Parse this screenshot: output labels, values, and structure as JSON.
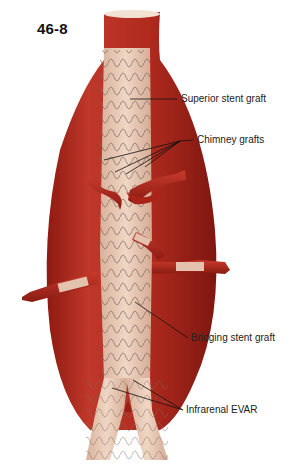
{
  "figure": {
    "number": "46-8",
    "labels": {
      "superior": "Superior stent graft",
      "chimney": "Chimney grafts",
      "bridging": "Bridging stent graft",
      "infrarenal": "Infrarenal EVAR"
    },
    "colors": {
      "aneurysm": "#b8281f",
      "aneurysm_dark": "#8e1a12",
      "graft_fabric": "#e8c9b4",
      "stent_wire": "#7a6a60",
      "vessel": "#b3281e",
      "leader_line": "#111111",
      "text": "#222222"
    }
  }
}
